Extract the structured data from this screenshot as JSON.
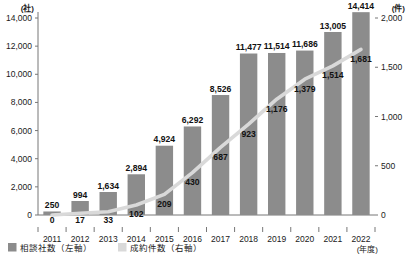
{
  "chart_data": {
    "type": "bar",
    "title": "",
    "subtitle": "",
    "xlabel": "(年度)",
    "categories": [
      "2011",
      "2012",
      "2013",
      "2014",
      "2015",
      "2016",
      "2017",
      "2018",
      "2019",
      "2020",
      "2021",
      "2022"
    ],
    "grid": false,
    "legend_position": "bottom-left",
    "axes": {
      "left": {
        "unit": "(社)",
        "label": "相談社数",
        "min": 0,
        "max": 14000,
        "step": 2000,
        "ticks": [
          "0",
          "2,000",
          "4,000",
          "6,000",
          "8,000",
          "10,000",
          "12,000",
          "14,000"
        ],
        "tick_values": [
          0,
          2000,
          4000,
          6000,
          8000,
          10000,
          12000,
          14000
        ]
      },
      "right": {
        "unit": "(件)",
        "label": "成約件数",
        "min": 0,
        "max": 2000,
        "step": 500,
        "ticks": [
          "0",
          "500",
          "1,000",
          "1,500",
          "2,000"
        ],
        "tick_values": [
          0,
          500,
          1000,
          1500,
          2000
        ]
      }
    },
    "series": [
      {
        "name": "相談社数（左軸）",
        "type": "bar",
        "axis": "left",
        "color": "#8c8c8c",
        "values": [
          250,
          994,
          1634,
          2894,
          4924,
          6292,
          8526,
          11477,
          11514,
          11686,
          13005,
          14414
        ],
        "labels": [
          "250",
          "994",
          "1,634",
          "2,894",
          "4,924",
          "6,292",
          "8,526",
          "11,477",
          "11,514",
          "11,686",
          "13,005",
          "14,414"
        ]
      },
      {
        "name": "成約件数（右軸）",
        "type": "line",
        "axis": "right",
        "color": "#d9d9d9",
        "values": [
          0,
          17,
          33,
          102,
          209,
          430,
          687,
          923,
          1176,
          1379,
          1514,
          1681
        ],
        "labels": [
          "0",
          "17",
          "33",
          "102",
          "209",
          "430",
          "687",
          "923",
          "1,176",
          "1,379",
          "1,514",
          "1,681"
        ]
      }
    ]
  },
  "legend": {
    "items": [
      {
        "label": "相談社数（左軸）",
        "color": "#8c8c8c",
        "marker": "square"
      },
      {
        "label": "成約件数（右軸）",
        "color": "#d9d9d9",
        "marker": "square"
      }
    ]
  }
}
